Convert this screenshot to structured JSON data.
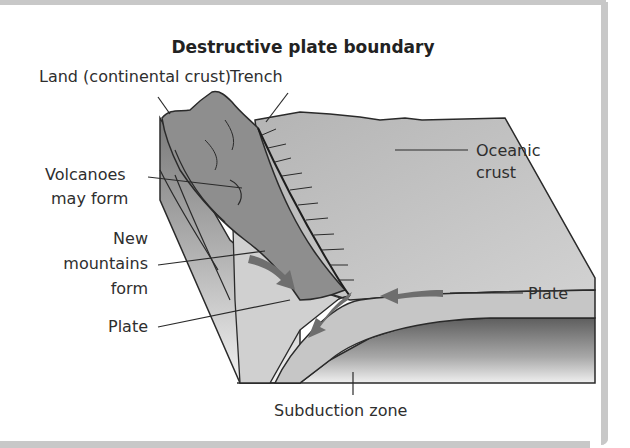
{
  "title": "Destructive plate boundary",
  "labels": {
    "land": "Land (continental crust)",
    "trench": "Trench",
    "oceanic_line1": "Oceanic",
    "oceanic_line2": "crust",
    "volcanoes_line1": "Volcanoes",
    "volcanoes_line2": "may form",
    "mountains_line1": "New",
    "mountains_line2": "mountains",
    "mountains_line3": "form",
    "plate_left": "Plate",
    "plate_right": "Plate",
    "subduction": "Subduction zone"
  },
  "colors": {
    "frame": "#c8c8c8",
    "crust_light": "#c4c4c4",
    "land_dark": "#8a8a8a",
    "arrow": "#6e6e6e",
    "outline": "#2a2a2a"
  }
}
